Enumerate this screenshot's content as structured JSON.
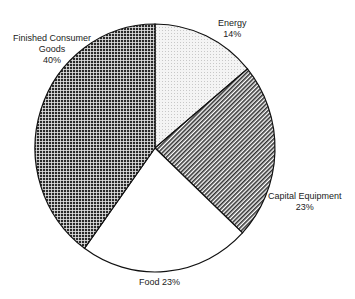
{
  "chart_data": {
    "type": "pie",
    "title": "",
    "categories": [
      "Energy",
      "Capital Equipment",
      "Food",
      "Finished Consumer Goods"
    ],
    "values": [
      14,
      23,
      23,
      40
    ],
    "labels": [
      {
        "name": "Energy",
        "value": "14%"
      },
      {
        "name": "Capital Equipment",
        "value": "23%"
      },
      {
        "name": "Food",
        "value": "23%"
      },
      {
        "name": "Finished Consumer Goods",
        "value": "40%"
      }
    ],
    "start_angle_deg_from_top": 0,
    "direction": "clockwise",
    "fills": [
      "light-dotted",
      "diagonal-hatch",
      "white",
      "dense-crosshatch"
    ]
  },
  "labels": {
    "energy_name": "Energy",
    "energy_pct": "14%",
    "capital_name": "Capital Equipment",
    "capital_pct": "23%",
    "food": "Food  23%",
    "fcg_line1": "Finished Consumer",
    "fcg_line2": "Goods",
    "fcg_pct": "40%"
  }
}
